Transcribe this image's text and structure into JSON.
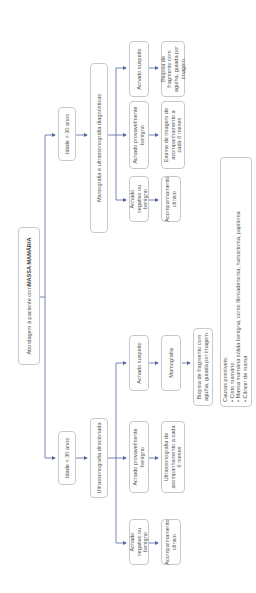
{
  "diagram": {
    "root": {
      "prefix": "Abordagem à paciente com ",
      "emphasis": "MASSA MAMÁRIA"
    },
    "branches": [
      {
        "condition": "Idade < 30 anos",
        "exam": "Ultrassonografia direcionada",
        "findings": [
          {
            "label": "Achado negativo ou benigno",
            "next": [
              "Acompanhamento clínico"
            ]
          },
          {
            "label": "Achado provavelmente benigno",
            "next": [
              "Ultrassonografia de acompanhamento a cada 6 meses"
            ]
          },
          {
            "label": "Achado suspeito",
            "next": [
              "Mamografia",
              "Biopsia de fragmento com agulha, guiada por imagem"
            ]
          }
        ]
      },
      {
        "condition": "Idade > 30 anos",
        "exam": "Mamografia e ultrassonografia diagnósticas",
        "findings": [
          {
            "label": "Achado negativo ou benigno",
            "next": [
              "Acompanhamento clínico"
            ]
          },
          {
            "label": "Achado provavelmente benigno",
            "next": [
              "Exame de imagem de acompanhamento a cada 6 meses"
            ]
          },
          {
            "label": "Achado suspeito",
            "next": [
              "Biopsia de fragmento com agulha, guiada por imagem"
            ]
          }
        ]
      }
    ],
    "causes": {
      "title": "Causas possíveis:",
      "items": [
        "• Cisto mamário",
        "• Massa mamária sólida benigna, como fibroadenoma, hamartoma, papiloma",
        "• Câncer de mama"
      ]
    },
    "colors": {
      "arrow": "#5566a0",
      "box_border": "#c8c8c8",
      "text": "#555555"
    }
  }
}
